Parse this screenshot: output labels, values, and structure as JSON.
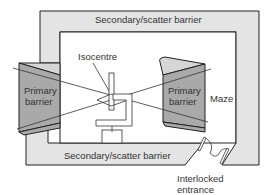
{
  "diagram": {
    "labels": {
      "secondary_top": "Secondary/scatter barrier",
      "secondary_bottom": "Secondary/scatter barrier",
      "primary_left_line1": "Primary",
      "primary_left_line2": "barrier",
      "primary_right_line1": "Primary",
      "primary_right_line2": "barrier",
      "isocentre": "Isocentre",
      "maze": "Maze",
      "entrance_line1": "Interlocked",
      "entrance_line2": "entrance"
    },
    "colors": {
      "secondary_fill": "#e4e4e4",
      "primary_fill": "#a9a9a9",
      "primary_light_fill": "#d6d6d6",
      "line": "#222222",
      "room_fill": "#ffffff"
    }
  }
}
